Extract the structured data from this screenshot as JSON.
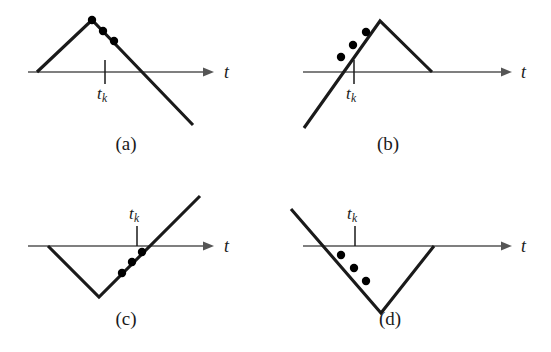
{
  "figure": {
    "background_color": "#ffffff",
    "curve_color": "#1a1a1a",
    "axis_color": "#555555",
    "marker_color": "#000000",
    "panels": [
      {
        "id": "a",
        "caption": "(a)",
        "caption_x": 126,
        "caption_y": 145,
        "axis": {
          "label": "t",
          "label_x": 224,
          "label_y": 62,
          "y": 72,
          "x_start": 28,
          "x_end": 214,
          "arrow_tip_x": 214
        },
        "tick": {
          "label_base": "t",
          "label_sub": "k",
          "x": 105,
          "label_x": 97,
          "label_y": 84,
          "top_y": 60,
          "bottom_y": 84
        },
        "waveform": {
          "shape": "rise-then-fall",
          "points": [
            [
              37,
              72
            ],
            [
              92,
              20
            ],
            [
              193,
              125
            ]
          ]
        },
        "markers": [
          [
            92,
            20
          ],
          [
            103,
            31
          ],
          [
            114,
            41
          ]
        ]
      },
      {
        "id": "b",
        "caption": "(b)",
        "caption_x": 388,
        "caption_y": 145,
        "axis": {
          "label": "t",
          "label_x": 521,
          "label_y": 62,
          "y": 72,
          "x_start": 303,
          "x_end": 512,
          "arrow_tip_x": 512
        },
        "tick": {
          "label_base": "t",
          "label_sub": "k",
          "x": 354,
          "label_x": 346,
          "label_y": 84,
          "top_y": 60,
          "bottom_y": 84
        },
        "waveform": {
          "shape": "rise-then-fall",
          "points": [
            [
              304,
              128
            ],
            [
              380,
              21
            ],
            [
              432,
              72
            ]
          ]
        },
        "markers": [
          [
            341,
            57
          ],
          [
            353,
            45
          ],
          [
            366,
            32
          ]
        ]
      },
      {
        "id": "c",
        "caption": "(c)",
        "caption_x": 126,
        "caption_y": 320,
        "axis": {
          "label": "t",
          "label_x": 224,
          "label_y": 236,
          "y": 246,
          "x_start": 28,
          "x_end": 214,
          "arrow_tip_x": 214
        },
        "tick": {
          "label_base": "t",
          "label_sub": "k",
          "x": 137,
          "label_x": 129,
          "label_y": 204,
          "top_y": 226,
          "bottom_y": 246
        },
        "waveform": {
          "shape": "fall-then-rise",
          "points": [
            [
              48,
              246
            ],
            [
              99,
              297
            ],
            [
              200,
              196
            ]
          ]
        },
        "markers": [
          [
            122,
            273
          ],
          [
            132,
            262
          ],
          [
            142,
            252
          ]
        ]
      },
      {
        "id": "d",
        "caption": "(d)",
        "caption_x": 390,
        "caption_y": 320,
        "axis": {
          "label": "t",
          "label_x": 521,
          "label_y": 236,
          "y": 246,
          "x_start": 303,
          "x_end": 512,
          "arrow_tip_x": 512
        },
        "tick": {
          "label_base": "t",
          "label_sub": "k",
          "x": 355,
          "label_x": 347,
          "label_y": 204,
          "top_y": 226,
          "bottom_y": 246
        },
        "waveform": {
          "shape": "fall-then-rise",
          "points": [
            [
              291,
              209
            ],
            [
              381,
              313
            ],
            [
              434,
              246
            ]
          ]
        },
        "markers": [
          [
            341,
            255
          ],
          [
            354,
            268
          ],
          [
            366,
            281
          ]
        ]
      }
    ]
  }
}
